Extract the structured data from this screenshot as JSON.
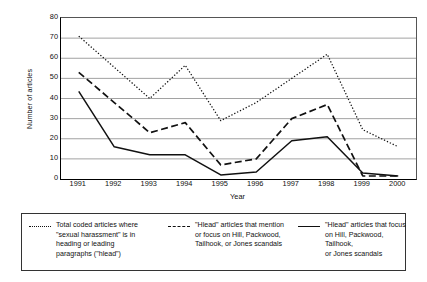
{
  "chart_data": {
    "type": "line",
    "title": "",
    "xlabel": "Year",
    "ylabel": "Number of articles",
    "categories": [
      "1991",
      "1992",
      "1993",
      "1994",
      "1995",
      "1996",
      "1997",
      "1998",
      "1999",
      "2000"
    ],
    "x": [
      1991,
      1992,
      1993,
      1994,
      1995,
      1996,
      1997,
      1998,
      1999,
      2000
    ],
    "ylim": [
      0,
      80
    ],
    "yticks": [
      0,
      10,
      20,
      30,
      40,
      50,
      60,
      70,
      80
    ],
    "grid": "horizontal",
    "legend_position": "below",
    "series": [
      {
        "name": "Total coded articles where \"sexual harassment\" is in heading or leading paragraphs (\"hlead\")",
        "style": "dotted",
        "values": [
          71,
          55.5,
          40,
          56.5,
          29,
          38,
          50,
          62,
          24.5,
          16
        ]
      },
      {
        "name": "\"Hlead\" articles that mention or focus on Hill, Packwood, Tailhook, or Jones scandals",
        "style": "dashed",
        "values": [
          53,
          38,
          23,
          28,
          7,
          10,
          30,
          37,
          1.5,
          1.5
        ]
      },
      {
        "name": "\"Hlead\" articles that focus on Hill, Packwood, Tailhook, or Jones scandals",
        "style": "solid",
        "values": [
          43.5,
          16,
          12,
          12,
          2,
          3.5,
          19,
          21,
          3,
          1.5
        ]
      }
    ]
  },
  "axis": {
    "y_title": "Number of articles",
    "x_title": "Year",
    "y_ticks": [
      "0",
      "10",
      "20",
      "30",
      "40",
      "50",
      "60",
      "70",
      "80"
    ],
    "x_ticks": [
      "1991",
      "1992",
      "1993",
      "1994",
      "1995",
      "1996",
      "1997",
      "1998",
      "1999",
      "2000"
    ]
  },
  "legend": {
    "items": [
      {
        "marker": "dotted-line-swatch",
        "label": "Total coded articles where\n\"sexual harassment\" is in\nheading or leading\nparagraphs (\"hlead\")"
      },
      {
        "marker": "dashed-line-swatch",
        "label": "\"Hlead\" articles that mention\nor focus on Hill, Packwood,\nTailhook, or Jones scandals"
      },
      {
        "marker": "solid-line-swatch",
        "label": "\"Hlead\" articles that focus\non Hill, Packwood, Tailhook,\nor Jones scandals"
      }
    ]
  },
  "colors": {
    "ink": "#111111",
    "grid": "#8a8a8a",
    "axis": "#000000",
    "background": "#ffffff"
  }
}
